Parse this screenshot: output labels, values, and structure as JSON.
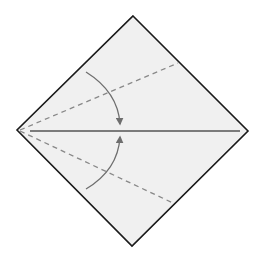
{
  "diagram": {
    "type": "origami-fold-instruction",
    "colors": {
      "background": "#ffffff",
      "paper_fill": "#f0f0f0",
      "outline": "#1a1a1a",
      "center_crease": "#555555",
      "valley_fold": "#888888",
      "arrow": "#6e6e6e"
    },
    "paper": {
      "vertices": {
        "top": [
          133,
          16
        ],
        "right": [
          248,
          131
        ],
        "bottom": [
          132,
          246
        ],
        "left": [
          17,
          130
        ]
      }
    },
    "center_crease": {
      "from": [
        30,
        131
      ],
      "to": [
        240,
        131
      ]
    },
    "valley_folds": [
      {
        "name": "upper",
        "from": [
          20,
          130
        ],
        "to": [
          178,
          63
        ]
      },
      {
        "name": "lower",
        "from": [
          20,
          131
        ],
        "to": [
          173,
          203
        ]
      }
    ],
    "arrows": [
      {
        "name": "upper-fold-arrow",
        "start": [
          86,
          72
        ],
        "tip": [
          120,
          127
        ],
        "direction": "down"
      },
      {
        "name": "lower-fold-arrow",
        "start": [
          86,
          189
        ],
        "tip": [
          120,
          135
        ],
        "direction": "up"
      }
    ]
  }
}
